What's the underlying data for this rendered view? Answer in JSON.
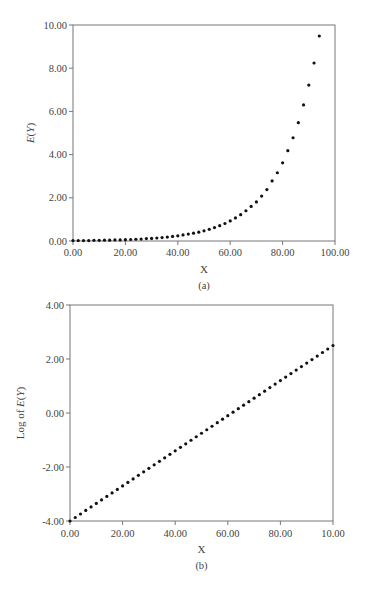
{
  "figure": {
    "panels": [
      {
        "caption": "(a)",
        "xlabel": "X",
        "ylabel": "E(Y)"
      },
      {
        "caption": "(b)",
        "xlabel": "X",
        "ylabel": "Log of E(Y)"
      }
    ]
  },
  "chart_data": [
    {
      "type": "scatter",
      "title": "",
      "caption": "(a)",
      "xlabel": "X",
      "ylabel": "E(Y)",
      "xlim": [
        0,
        100
      ],
      "ylim": [
        0,
        10
      ],
      "xticks": [
        0,
        20,
        40,
        60,
        80,
        100
      ],
      "xtick_labels": [
        "0.00",
        "20.00",
        "40.00",
        "60.00",
        "80.00",
        "100.00"
      ],
      "yticks": [
        0,
        2,
        4,
        6,
        8,
        10
      ],
      "ytick_labels": [
        "0.00",
        "2.00",
        "4.00",
        "6.00",
        "8.00",
        "10.00"
      ],
      "grid": false,
      "legend": null,
      "series": [
        {
          "name": "E(Y)",
          "x": [
            0,
            2,
            4,
            6,
            8,
            10,
            12,
            14,
            16,
            18,
            20,
            22,
            24,
            26,
            28,
            30,
            32,
            34,
            36,
            38,
            40,
            42,
            44,
            46,
            48,
            50,
            52,
            54,
            56,
            58,
            60,
            62,
            64,
            66,
            68,
            70,
            72,
            74,
            76,
            78,
            80,
            82,
            84,
            86,
            88,
            90,
            92,
            94
          ],
          "y": [
            0.02,
            0.02,
            0.02,
            0.02,
            0.03,
            0.03,
            0.04,
            0.04,
            0.05,
            0.05,
            0.06,
            0.07,
            0.08,
            0.09,
            0.11,
            0.12,
            0.14,
            0.16,
            0.18,
            0.21,
            0.24,
            0.28,
            0.32,
            0.36,
            0.41,
            0.47,
            0.54,
            0.62,
            0.71,
            0.81,
            0.93,
            1.07,
            1.22,
            1.4,
            1.6,
            1.81,
            2.08,
            2.38,
            2.78,
            3.16,
            3.62,
            4.18,
            4.78,
            5.48,
            6.3,
            7.22,
            8.24,
            9.49
          ]
        }
      ]
    },
    {
      "type": "scatter",
      "title": "",
      "caption": "(b)",
      "xlabel": "X",
      "ylabel": "Log of E(Y)",
      "xlim": [
        0,
        100
      ],
      "ylim": [
        -4,
        4
      ],
      "xticks": [
        0,
        20,
        40,
        60,
        80,
        100
      ],
      "xtick_labels": [
        "0.00",
        "20.00",
        "40.00",
        "60.00",
        "80.00",
        "10.00"
      ],
      "yticks": [
        -4,
        -2,
        0,
        2,
        4
      ],
      "ytick_labels": [
        "-4.00",
        "-2.00",
        "0.00",
        "2.00",
        "4.00"
      ],
      "grid": false,
      "legend": null,
      "series": [
        {
          "name": "Log of E(Y)",
          "x": [
            0,
            2,
            4,
            6,
            8,
            10,
            12,
            14,
            16,
            18,
            20,
            22,
            24,
            26,
            28,
            30,
            32,
            34,
            36,
            38,
            40,
            42,
            44,
            46,
            48,
            50,
            52,
            54,
            56,
            58,
            60,
            62,
            64,
            66,
            68,
            70,
            72,
            74,
            76,
            78,
            80,
            82,
            84,
            86,
            88,
            90,
            92,
            94,
            96,
            98,
            100
          ],
          "y": [
            -4.0,
            -3.87,
            -3.74,
            -3.61,
            -3.48,
            -3.35,
            -3.22,
            -3.09,
            -2.96,
            -2.83,
            -2.7,
            -2.57,
            -2.44,
            -2.31,
            -2.18,
            -2.05,
            -1.92,
            -1.79,
            -1.66,
            -1.53,
            -1.4,
            -1.27,
            -1.14,
            -1.01,
            -0.88,
            -0.75,
            -0.62,
            -0.49,
            -0.36,
            -0.23,
            -0.1,
            0.03,
            0.16,
            0.29,
            0.42,
            0.55,
            0.68,
            0.81,
            0.94,
            1.07,
            1.2,
            1.33,
            1.46,
            1.59,
            1.72,
            1.85,
            1.98,
            2.11,
            2.24,
            2.37,
            2.5
          ]
        }
      ]
    }
  ]
}
